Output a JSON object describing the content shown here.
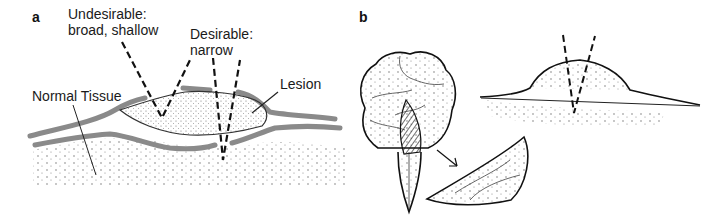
{
  "panel_a": {
    "letter": "a",
    "labels": {
      "undesirable_line1": "Undesirable:",
      "undesirable_line2": "broad, shallow",
      "desirable_line1": "Desirable:",
      "desirable_line2": "narrow",
      "lesion": "Lesion",
      "normal_tissue": "Normal Tissue"
    }
  },
  "panel_b": {
    "letter": "b"
  },
  "colors": {
    "line": "#111111",
    "tissue_band": "#8a8a8a",
    "stipple": "#555555"
  }
}
